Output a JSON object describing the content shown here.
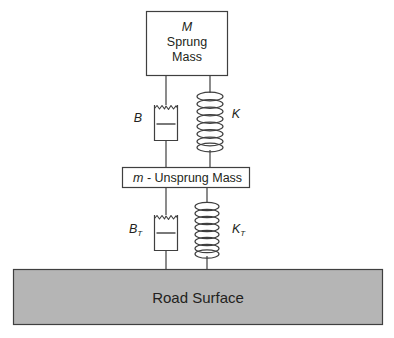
{
  "figure": {
    "background_color": "#ffffff",
    "line_color": "#3f3f3f",
    "text_color": "#231f20",
    "road_fill_color": "#b5b5b5"
  },
  "sprung_mass_box": {
    "symbol": "M",
    "line1": "Sprung",
    "line2": "Mass"
  },
  "unsprung_mass_box": {
    "symbol": "m",
    "text": "- Unsprung Mass"
  },
  "road": {
    "label": "Road Surface"
  },
  "components": {
    "damper_upper": {
      "label": "B",
      "subscript": ""
    },
    "spring_upper": {
      "label": "K",
      "subscript": ""
    },
    "damper_lower": {
      "label": "B",
      "subscript": "T"
    },
    "spring_lower": {
      "label": "K",
      "subscript": "T"
    }
  }
}
